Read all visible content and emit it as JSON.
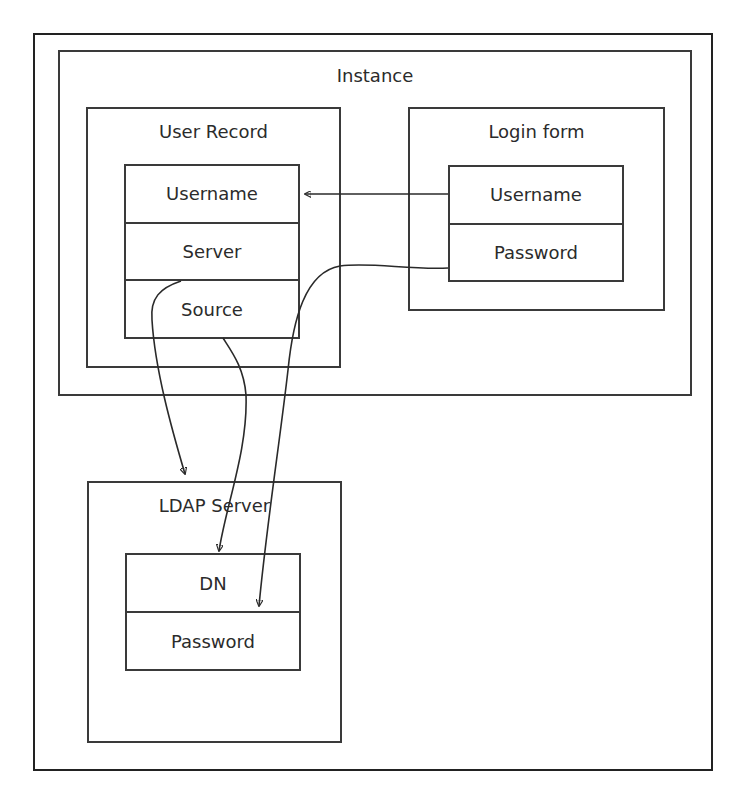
{
  "diagram": {
    "containers": {
      "instance": {
        "label": "Instance"
      },
      "user_record": {
        "label": "User Record"
      },
      "login_form": {
        "label": "Login form"
      },
      "ldap_server": {
        "label": "LDAP Server"
      }
    },
    "user_record_fields": [
      "Username",
      "Server",
      "Source"
    ],
    "login_form_fields": [
      "Username",
      "Password"
    ],
    "ldap_server_fields": [
      "DN",
      "Password"
    ],
    "edges": [
      {
        "from": "Login form.Username",
        "to": "User Record.Username"
      },
      {
        "from": "User Record.Server",
        "to": "LDAP Server"
      },
      {
        "from": "User Record.Source",
        "to": "LDAP Server.DN"
      },
      {
        "from": "Login form.Password",
        "to": "LDAP Server.Password"
      }
    ],
    "colors": {
      "stroke": "#3a3a3a",
      "text": "#2b2b2b",
      "background": "#ffffff"
    }
  }
}
